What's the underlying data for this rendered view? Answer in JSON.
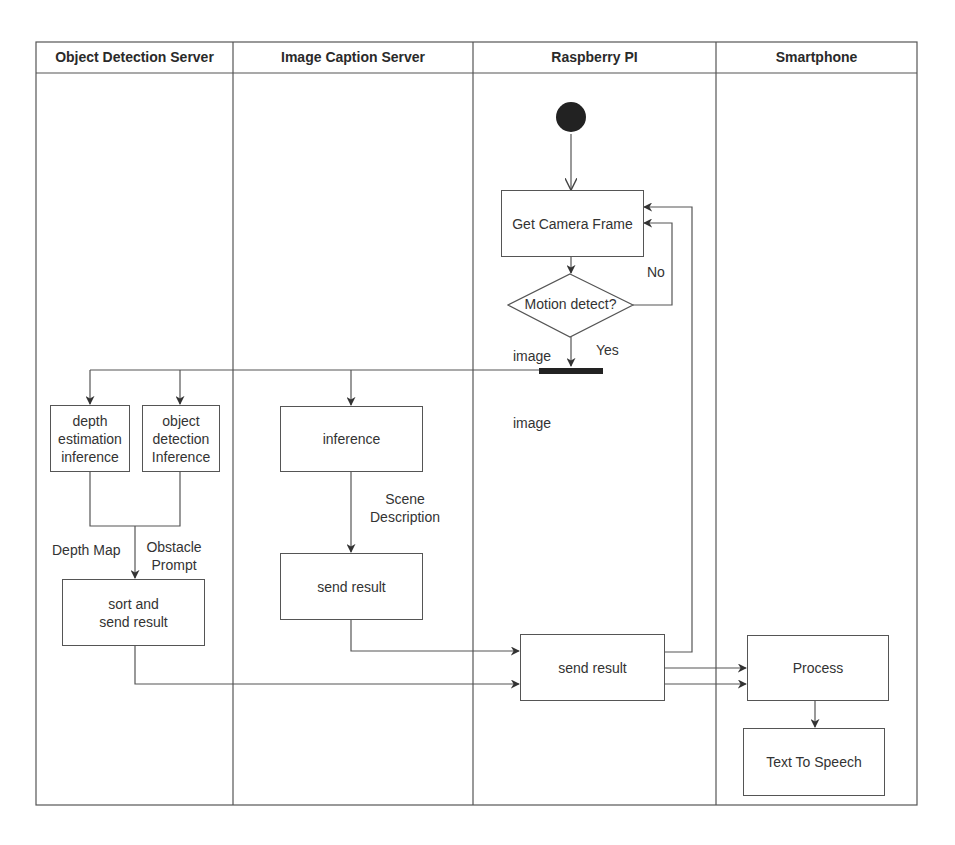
{
  "swimlanes": [
    {
      "id": "object-detection-server",
      "title": "Object Detection Server"
    },
    {
      "id": "image-caption-server",
      "title": "Image Caption Server"
    },
    {
      "id": "raspberry-pi",
      "title": "Raspberry PI"
    },
    {
      "id": "smartphone",
      "title": "Smartphone"
    }
  ],
  "nodes": {
    "start": {
      "type": "initial"
    },
    "get_camera_frame": {
      "label": "Get Camera Frame",
      "lane": "raspberry-pi"
    },
    "motion_detect": {
      "label": "Motion detect?",
      "lane": "raspberry-pi",
      "type": "decision"
    },
    "fork": {
      "type": "fork",
      "lane": "raspberry-pi"
    },
    "depth_estimation": {
      "label_lines": [
        "depth",
        "estimation",
        "inference"
      ],
      "lane": "object-detection-server"
    },
    "object_detection": {
      "label_lines": [
        "object",
        "detection",
        "Inference"
      ],
      "lane": "object-detection-server"
    },
    "sort_and_send": {
      "label_lines": [
        "sort and",
        "send result"
      ],
      "lane": "object-detection-server"
    },
    "caption_inference": {
      "label": "inference",
      "lane": "image-caption-server"
    },
    "caption_send": {
      "label": "send result",
      "lane": "image-caption-server"
    },
    "rpi_send": {
      "label": "send result",
      "lane": "raspberry-pi"
    },
    "process": {
      "label": "Process",
      "lane": "smartphone"
    },
    "tts": {
      "label": "Text To Speech",
      "lane": "smartphone"
    }
  },
  "edge_labels": {
    "no": "No",
    "yes": "Yes",
    "image_top": "image",
    "image_lower": "image",
    "scene_description": [
      "Scene",
      "Description"
    ],
    "depth_map": "Depth Map",
    "obstacle_prompt": [
      "Obstacle",
      "Prompt"
    ]
  },
  "colors": {
    "line": "#555555",
    "text": "#333333",
    "fill_dark": "#222222",
    "background": "#ffffff"
  }
}
